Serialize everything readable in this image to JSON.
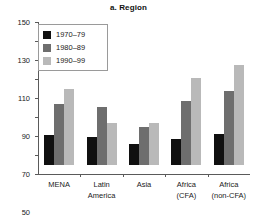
{
  "chart_data": {
    "type": "bar",
    "title": "a. Region",
    "xlabel": "",
    "ylabel": "",
    "ylim": [
      -10,
      150
    ],
    "ytick_step": 20,
    "yticks": [
      "150",
      "130",
      "110",
      "90",
      "70",
      "50",
      "30",
      "10",
      "−10"
    ],
    "grid": false,
    "legend_position": "top-left",
    "categories": [
      "MENA",
      "Latin America",
      "Asia",
      "Africa (CFA)",
      "Africa (non-CFA)"
    ],
    "category_lines": [
      [
        "MENA"
      ],
      [
        "Latin",
        "America"
      ],
      [
        "Asia"
      ],
      [
        "Africa",
        "(CFA)"
      ],
      [
        "Africa",
        "(non-CFA)"
      ]
    ],
    "series": [
      {
        "name": "1970–79",
        "color": "#101010",
        "values": [
          31,
          29,
          22,
          27,
          32
        ]
      },
      {
        "name": "1980–89",
        "color": "#6e6e6e",
        "values": [
          64,
          61,
          40,
          67,
          77
        ]
      },
      {
        "name": "1990–99",
        "color": "#b9b9b9",
        "values": [
          79,
          44,
          44,
          91,
          105
        ]
      }
    ]
  }
}
